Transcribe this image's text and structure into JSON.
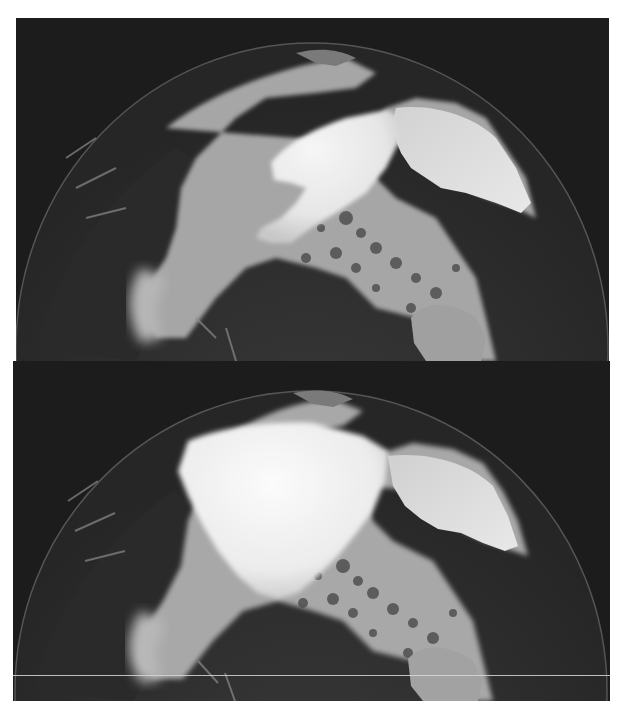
{
  "figure": {
    "panels": [
      {
        "id": "top",
        "label": "",
        "ice_shape": "narrow tongue extending from Greenland across the pole"
      },
      {
        "id": "bottom",
        "label": "",
        "ice_shape": "broad ice cap covering central Arctic Ocean"
      }
    ],
    "colors": {
      "space": "#1c1c1c",
      "land_dark": "#2e2e2e",
      "ocean_ice_gray": "#a8a8a8",
      "sea_ice_white": "#eeeeee",
      "greenland": "#d9d9d9",
      "limb": "#5a5a5a"
    }
  }
}
